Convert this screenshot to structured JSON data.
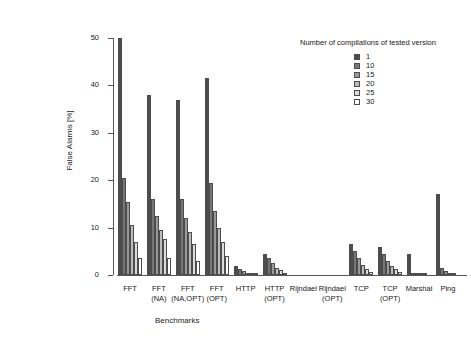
{
  "chart_data": {
    "type": "bar",
    "title": "",
    "xlabel": "Benchmarks",
    "ylabel": "False Alarms [%]",
    "ylim": [
      0,
      50
    ],
    "yticks": [
      0,
      10,
      20,
      30,
      40,
      50
    ],
    "grid": false,
    "legend_position": "top-right",
    "legend_title": "Number of compilations of tested version",
    "categories": [
      "FFT",
      "FFT\n(NA)",
      "FFT\n(NA,OPT)",
      "FFT\n(OPT)",
      "HTTP",
      "HTTP\n(OPT)",
      "Rijndael",
      "Rijndael\n(OPT)",
      "TCP",
      "TCP\n(OPT)",
      "Marshal",
      "Ping"
    ],
    "series": [
      {
        "name": "1",
        "color": "#4d4d4d",
        "values": [
          50.0,
          38.0,
          37.0,
          41.5,
          2.0,
          4.5,
          0.0,
          0.0,
          6.5,
          6.0,
          4.5,
          17.0
        ]
      },
      {
        "name": "10",
        "color": "#767676",
        "values": [
          20.5,
          16.0,
          16.0,
          19.5,
          1.2,
          3.5,
          0.0,
          0.0,
          5.0,
          4.5,
          0.4,
          1.5
        ]
      },
      {
        "name": "15",
        "color": "#9a9a9a",
        "values": [
          15.5,
          12.5,
          12.0,
          13.5,
          0.8,
          2.5,
          0.0,
          0.0,
          3.5,
          3.0,
          0.3,
          0.8
        ]
      },
      {
        "name": "20",
        "color": "#bcbcbc",
        "values": [
          10.5,
          9.5,
          9.0,
          10.0,
          0.5,
          1.5,
          0.0,
          0.0,
          2.2,
          2.0,
          0.2,
          0.4
        ]
      },
      {
        "name": "25",
        "color": "#dcdcdc",
        "values": [
          7.0,
          7.5,
          6.5,
          7.0,
          0.3,
          1.0,
          0.0,
          0.0,
          1.3,
          1.2,
          0.1,
          0.2
        ]
      },
      {
        "name": "30",
        "color": "#ffffff",
        "values": [
          3.5,
          3.5,
          3.0,
          4.0,
          0.2,
          0.5,
          0.0,
          0.0,
          0.7,
          0.6,
          0.0,
          0.0
        ]
      }
    ]
  },
  "axes": {
    "y_title": "False Alarms [%]",
    "x_title": "Benchmarks",
    "y_tick_labels": [
      "0",
      "10",
      "20",
      "30",
      "40",
      "50"
    ]
  },
  "legend": {
    "title": "Number of compilations of tested version",
    "entries": [
      {
        "label": "1",
        "color": "#4d4d4d"
      },
      {
        "label": "10",
        "color": "#767676"
      },
      {
        "label": "15",
        "color": "#9a9a9a"
      },
      {
        "label": "20",
        "color": "#bcbcbc"
      },
      {
        "label": "25",
        "color": "#dcdcdc"
      },
      {
        "label": "30",
        "color": "#ffffff"
      }
    ]
  }
}
